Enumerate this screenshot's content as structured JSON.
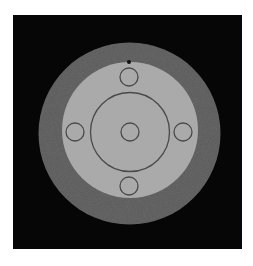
{
  "canvas": {
    "width": 253,
    "height": 266,
    "background": "#ffffff"
  },
  "frame": {
    "x": 13,
    "y": 15,
    "width": 229,
    "height": 234,
    "color": "#060606"
  },
  "outer_disk": {
    "cx": 129.5,
    "cy": 133.5,
    "r": 91,
    "color": "#585858"
  },
  "inner_disk": {
    "cx": 130,
    "cy": 130,
    "r": 68,
    "color": "#a9a9a9"
  },
  "center_ring": {
    "cx": 130,
    "cy": 132,
    "r": 39.5,
    "stroke": "#4a4a4a",
    "stroke_width": 1.3
  },
  "small_circles": [
    {
      "name": "top",
      "cx": 129,
      "cy": 77,
      "r": 9,
      "stroke": "#4a4a4a"
    },
    {
      "name": "left",
      "cx": 75,
      "cy": 132,
      "r": 9,
      "stroke": "#4a4a4a"
    },
    {
      "name": "center",
      "cx": 130,
      "cy": 132,
      "r": 9,
      "stroke": "#4a4a4a"
    },
    {
      "name": "right",
      "cx": 183,
      "cy": 132,
      "r": 9,
      "stroke": "#4a4a4a"
    },
    {
      "name": "bottom",
      "cx": 129,
      "cy": 186,
      "r": 9,
      "stroke": "#4a4a4a"
    }
  ],
  "marker_dot": {
    "cx": 129,
    "cy": 62,
    "r": 2,
    "color": "#111111"
  }
}
